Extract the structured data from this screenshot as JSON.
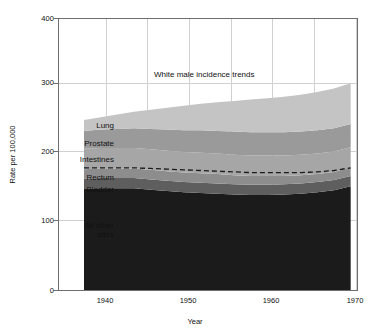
{
  "chart_data": {
    "type": "area",
    "title": "",
    "annotation": "White male incidence trends",
    "xlabel": "Year",
    "ylabel": "Rate per 100,000",
    "xlim": [
      1935,
      1971
    ],
    "ylim": [
      0,
      400
    ],
    "xticks": [
      "1940",
      "1950",
      "1960",
      "1970"
    ],
    "xtick_values": [
      1940,
      1950,
      1960,
      1970
    ],
    "yticks": [
      "0",
      "100",
      "200",
      "300",
      "400"
    ],
    "ytick_values": [
      0,
      100,
      200,
      300,
      400
    ],
    "grid": "both",
    "legend": "inline-left-labels",
    "x": [
      1938,
      1940,
      1942,
      1944,
      1946,
      1948,
      1950,
      1952,
      1954,
      1956,
      1958,
      1960,
      1962,
      1964,
      1966,
      1968,
      1970
    ],
    "series": [
      {
        "name": "All other sites",
        "color": "#1b1b1b",
        "values": [
          151,
          152,
          152,
          152,
          150,
          148,
          146,
          145,
          144,
          143,
          142,
          142,
          143,
          144,
          146,
          149,
          155
        ]
      },
      {
        "name": "Bladder",
        "color": "#5e5e5e",
        "values": [
          15,
          15,
          15,
          15,
          15,
          15,
          15,
          15,
          15,
          15,
          15,
          15,
          15,
          15,
          15,
          15,
          15
        ]
      },
      {
        "name": "Rectum",
        "color": "#8d8d8d",
        "values": [
          14,
          14,
          14,
          14,
          14,
          14,
          14,
          14,
          14,
          13,
          13,
          13,
          12,
          12,
          12,
          12,
          12
        ]
      },
      {
        "name": "Intestines",
        "color": "#a6a6a6",
        "values": [
          30,
          30,
          30,
          30,
          30,
          30,
          30,
          30,
          30,
          30,
          30,
          30,
          30,
          30,
          30,
          30,
          30
        ]
      },
      {
        "name": "Prostate",
        "color": "#9a9a9a",
        "values": [
          26,
          27,
          28,
          29,
          30,
          31,
          32,
          33,
          33,
          34,
          34,
          34,
          34,
          34,
          34,
          34,
          34
        ]
      },
      {
        "name": "Lung",
        "color": "#c4c4c4",
        "values": [
          16,
          18,
          21,
          24,
          28,
          32,
          36,
          39,
          42,
          45,
          48,
          50,
          52,
          54,
          56,
          58,
          60
        ]
      }
    ],
    "totals": [
      252,
      256,
      260,
      264,
      267,
      270,
      273,
      276,
      278,
      280,
      282,
      284,
      286,
      289,
      293,
      298,
      306
    ],
    "dashed_line": {
      "label": "",
      "style": "dashed",
      "color": "#1a1a1a",
      "values": [
        182,
        182,
        182,
        182,
        181,
        180,
        179,
        178,
        177,
        176,
        175,
        175,
        175,
        175,
        176,
        178,
        182
      ]
    },
    "series_labels": [
      {
        "name": "Lung",
        "text": "Lung"
      },
      {
        "name": "Prostate",
        "text": "Prostate"
      },
      {
        "name": "Intestines",
        "text": "Intestines"
      },
      {
        "name": "Rectum",
        "text": "Rectum"
      },
      {
        "name": "Bladder",
        "text": "Bladder"
      },
      {
        "name": "All other",
        "text": "All other"
      },
      {
        "name": "sites",
        "text": "sites"
      }
    ],
    "colors": {
      "frame": "#6e6e6e",
      "grid": "#d0d0d0",
      "background": "#ffffff",
      "text": "#111111"
    }
  }
}
